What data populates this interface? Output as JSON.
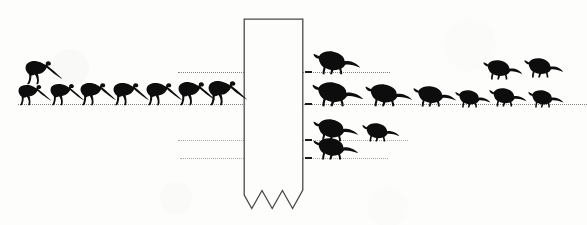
{
  "figure": {
    "title": "Dinosaur silhouette size-distribution figure",
    "caption": "",
    "background_color": "#fdfdfb",
    "ink_color": "#0d0d0d",
    "line_color": "#6d6d6d",
    "width": 587,
    "height": 225
  },
  "banner": {
    "name": "central-vertical-column",
    "description": "vertical ribbon with torn zigzag bottom edge",
    "x": 243,
    "y": 18,
    "width": 61,
    "height": 192,
    "stroke_color": "#4a4a4a",
    "fill_color": "#fdfdfb",
    "zigzag_teeth": 3
  },
  "baselines": [
    {
      "id": "line-1",
      "y": 72,
      "x_start": 178,
      "x_end": 390,
      "style": "dotted"
    },
    {
      "id": "line-2",
      "y": 104,
      "x_start": 18,
      "x_end": 587,
      "style": "dotted"
    },
    {
      "id": "line-3",
      "y": 140,
      "x_start": 178,
      "x_end": 408,
      "style": "dotted"
    },
    {
      "id": "line-4",
      "y": 158,
      "x_start": 180,
      "x_end": 388,
      "style": "dotted"
    }
  ],
  "ticks": [
    {
      "id": "tick-1",
      "x": 305,
      "y": 72
    },
    {
      "id": "tick-2",
      "x": 305,
      "y": 104
    },
    {
      "id": "tick-3",
      "x": 305,
      "y": 140
    },
    {
      "id": "tick-4",
      "x": 305,
      "y": 158
    }
  ],
  "silhouettes": {
    "left_group_type": "slender-prosauropod",
    "right_group_type": "stocky-armoured",
    "total_count": 23,
    "items": [
      {
        "id": "dino-L1",
        "group": "left",
        "shape": "slender",
        "x": 18,
        "y": 84,
        "w": 34,
        "h": 22,
        "flip": false
      },
      {
        "id": "dino-L2",
        "group": "left",
        "shape": "slender",
        "x": 25,
        "y": 60,
        "w": 38,
        "h": 25,
        "flip": false
      },
      {
        "id": "dino-L3",
        "group": "left",
        "shape": "slender",
        "x": 50,
        "y": 83,
        "w": 35,
        "h": 23,
        "flip": false
      },
      {
        "id": "dino-L4",
        "group": "left",
        "shape": "slender",
        "x": 80,
        "y": 82,
        "w": 37,
        "h": 24,
        "flip": false
      },
      {
        "id": "dino-L5",
        "group": "left",
        "shape": "slender",
        "x": 113,
        "y": 82,
        "w": 37,
        "h": 24,
        "flip": false
      },
      {
        "id": "dino-L6",
        "group": "left",
        "shape": "slender",
        "x": 146,
        "y": 82,
        "w": 37,
        "h": 24,
        "flip": false
      },
      {
        "id": "dino-L7",
        "group": "left",
        "shape": "slender",
        "x": 178,
        "y": 81,
        "w": 38,
        "h": 25,
        "flip": false
      },
      {
        "id": "dino-L8",
        "group": "left",
        "shape": "slender",
        "x": 208,
        "y": 80,
        "w": 40,
        "h": 26,
        "flip": false
      },
      {
        "id": "dino-R1",
        "group": "right",
        "shape": "stocky",
        "x": 313,
        "y": 51,
        "w": 48,
        "h": 24,
        "flip": false
      },
      {
        "id": "dino-R2",
        "group": "right",
        "shape": "stocky",
        "x": 312,
        "y": 82,
        "w": 52,
        "h": 25,
        "flip": false
      },
      {
        "id": "dino-R3",
        "group": "right",
        "shape": "stocky",
        "x": 365,
        "y": 84,
        "w": 48,
        "h": 23,
        "flip": false
      },
      {
        "id": "dino-R4",
        "group": "right",
        "shape": "stocky",
        "x": 413,
        "y": 86,
        "w": 44,
        "h": 21,
        "flip": false
      },
      {
        "id": "dino-R5",
        "group": "right",
        "shape": "stocky",
        "x": 455,
        "y": 90,
        "w": 36,
        "h": 18,
        "flip": false
      },
      {
        "id": "dino-R6",
        "group": "right",
        "shape": "stocky",
        "x": 489,
        "y": 88,
        "w": 38,
        "h": 19,
        "flip": false
      },
      {
        "id": "dino-R7",
        "group": "right",
        "shape": "stocky",
        "x": 528,
        "y": 90,
        "w": 36,
        "h": 18,
        "flip": false
      },
      {
        "id": "dino-R8",
        "group": "right",
        "shape": "stocky",
        "x": 483,
        "y": 60,
        "w": 40,
        "h": 20,
        "flip": false
      },
      {
        "id": "dino-R9",
        "group": "right",
        "shape": "stocky",
        "x": 524,
        "y": 58,
        "w": 40,
        "h": 20,
        "flip": false
      },
      {
        "id": "dino-R10",
        "group": "right",
        "shape": "stocky",
        "x": 313,
        "y": 119,
        "w": 46,
        "h": 23,
        "flip": false
      },
      {
        "id": "dino-R11",
        "group": "right",
        "shape": "stocky",
        "x": 362,
        "y": 123,
        "w": 38,
        "h": 19,
        "flip": false
      },
      {
        "id": "dino-R12",
        "group": "right",
        "shape": "stocky",
        "x": 313,
        "y": 138,
        "w": 46,
        "h": 22,
        "flip": false
      }
    ]
  }
}
